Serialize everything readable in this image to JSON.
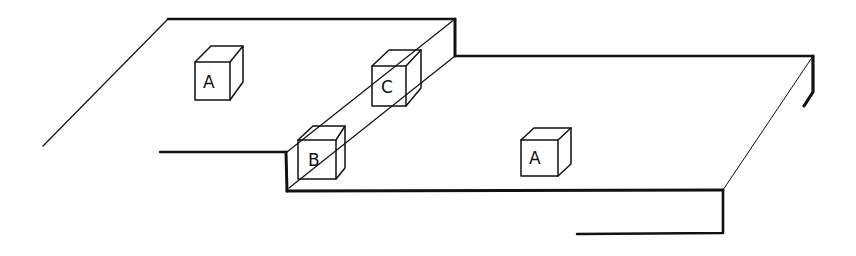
{
  "diagram": {
    "type": "isometric line drawing",
    "stroke_color": "#111111",
    "background": "#ffffff",
    "cubes": [
      {
        "label": "A",
        "location": "upper plate"
      },
      {
        "label": "C",
        "location": "step wall, upper"
      },
      {
        "label": "B",
        "location": "step wall, lower"
      },
      {
        "label": "A",
        "location": "lower plate"
      }
    ]
  }
}
